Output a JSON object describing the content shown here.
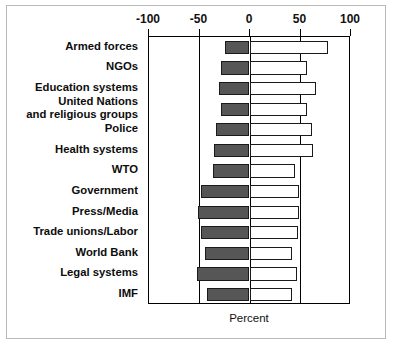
{
  "chart_data": {
    "type": "bar",
    "orientation": "horizontal",
    "subtype": "diverging-stacked",
    "title": "",
    "xlabel": "Percent",
    "ylabel": "",
    "xlim": [
      -100,
      100
    ],
    "xticks": [
      -100,
      -50,
      0,
      50,
      100
    ],
    "xtick_labels": [
      "-100",
      "-50",
      "0",
      "50",
      "100"
    ],
    "grid": false,
    "legend": "none",
    "categories": [
      "Armed forces",
      "NGOs",
      "Education systems",
      "United Nations\nand religious groups",
      "Police",
      "Health systems",
      "WTO",
      "Government",
      "Press/Media",
      "Trade unions/Labor",
      "World Bank",
      "Legal systems",
      "IMF"
    ],
    "series": [
      {
        "name": "Negative",
        "color": "#565656",
        "values": [
          -24,
          -28,
          -30,
          -28,
          -33,
          -35,
          -36,
          -48,
          -51,
          -48,
          -44,
          -52,
          -42
        ]
      },
      {
        "name": "Positive",
        "color": "#ffffff",
        "values": [
          78,
          57,
          66,
          57,
          62,
          63,
          45,
          49,
          49,
          48,
          42,
          47,
          42
        ]
      }
    ]
  },
  "axis": {
    "x_label_text": "Percent",
    "tick_minus100": "-100",
    "tick_minus50": "-50",
    "tick_zero": "0",
    "tick_50": "50",
    "tick_100": "100"
  },
  "colors": {
    "negative_bar": "#565656",
    "positive_bar": "#ffffff",
    "bar_outline": "#1a1a1a",
    "axis": "#000000",
    "frame_border": "#b9b9b9",
    "text": "#111111",
    "background": "#ffffff"
  }
}
